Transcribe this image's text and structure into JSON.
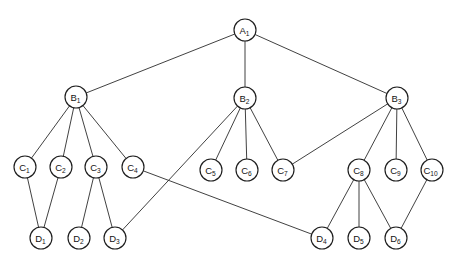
{
  "diagram": {
    "type": "node-link tree diagram",
    "node_shape": "circle",
    "node_radius": 11,
    "colors": {
      "background": "#ffffff",
      "node_fill": "#ffffff",
      "node_stroke": "#1e1e1e",
      "edge_stroke": "#2b2b2b",
      "label_color": "#131313"
    },
    "levels": [
      "A",
      "B",
      "C",
      "D"
    ],
    "nodes": [
      {
        "id": "A1",
        "base": "A",
        "sub": "1",
        "x": 245,
        "y": 30,
        "level": 0
      },
      {
        "id": "B1",
        "base": "B",
        "sub": "1",
        "x": 76,
        "y": 97,
        "level": 1
      },
      {
        "id": "B2",
        "base": "B",
        "sub": "2",
        "x": 245,
        "y": 98,
        "level": 1
      },
      {
        "id": "B3",
        "base": "B",
        "sub": "3",
        "x": 397,
        "y": 98,
        "level": 1
      },
      {
        "id": "C1",
        "base": "C",
        "sub": "1",
        "x": 25,
        "y": 167,
        "level": 2
      },
      {
        "id": "C2",
        "base": "C",
        "sub": "2",
        "x": 61,
        "y": 167,
        "level": 2
      },
      {
        "id": "C3",
        "base": "C",
        "sub": "3",
        "x": 96,
        "y": 167,
        "level": 2
      },
      {
        "id": "C4",
        "base": "C",
        "sub": "4",
        "x": 133,
        "y": 167,
        "level": 2
      },
      {
        "id": "C5",
        "base": "C",
        "sub": "5",
        "x": 211,
        "y": 170,
        "level": 2
      },
      {
        "id": "C6",
        "base": "C",
        "sub": "6",
        "x": 247,
        "y": 170,
        "level": 2
      },
      {
        "id": "C7",
        "base": "C",
        "sub": "7",
        "x": 283,
        "y": 170,
        "level": 2
      },
      {
        "id": "C8",
        "base": "C",
        "sub": "8",
        "x": 359,
        "y": 170,
        "level": 2
      },
      {
        "id": "C9",
        "base": "C",
        "sub": "9",
        "x": 396,
        "y": 170,
        "level": 2
      },
      {
        "id": "C10",
        "base": "C",
        "sub": "10",
        "x": 432,
        "y": 170,
        "level": 2
      },
      {
        "id": "D1",
        "base": "D",
        "sub": "1",
        "x": 41,
        "y": 238,
        "level": 3
      },
      {
        "id": "D2",
        "base": "D",
        "sub": "2",
        "x": 79,
        "y": 238,
        "level": 3
      },
      {
        "id": "D3",
        "base": "D",
        "sub": "3",
        "x": 115,
        "y": 238,
        "level": 3
      },
      {
        "id": "D4",
        "base": "D",
        "sub": "4",
        "x": 322,
        "y": 238,
        "level": 3
      },
      {
        "id": "D5",
        "base": "D",
        "sub": "5",
        "x": 359,
        "y": 238,
        "level": 3
      },
      {
        "id": "D6",
        "base": "D",
        "sub": "6",
        "x": 396,
        "y": 238,
        "level": 3
      }
    ],
    "edges": [
      {
        "from": "A1",
        "to": "B1"
      },
      {
        "from": "A1",
        "to": "B2"
      },
      {
        "from": "A1",
        "to": "B3"
      },
      {
        "from": "B1",
        "to": "C1"
      },
      {
        "from": "B1",
        "to": "C2"
      },
      {
        "from": "B1",
        "to": "C3"
      },
      {
        "from": "B1",
        "to": "C4"
      },
      {
        "from": "B2",
        "to": "C5"
      },
      {
        "from": "B2",
        "to": "C6"
      },
      {
        "from": "B2",
        "to": "C7"
      },
      {
        "from": "B2",
        "to": "D3"
      },
      {
        "from": "B3",
        "to": "C7"
      },
      {
        "from": "B3",
        "to": "C8"
      },
      {
        "from": "B3",
        "to": "C9"
      },
      {
        "from": "B3",
        "to": "C10"
      },
      {
        "from": "C1",
        "to": "D1"
      },
      {
        "from": "C2",
        "to": "D1"
      },
      {
        "from": "C3",
        "to": "D2"
      },
      {
        "from": "C3",
        "to": "D3"
      },
      {
        "from": "C4",
        "to": "D4"
      },
      {
        "from": "C8",
        "to": "D4"
      },
      {
        "from": "C8",
        "to": "D5"
      },
      {
        "from": "C8",
        "to": "D6"
      },
      {
        "from": "C10",
        "to": "D6"
      }
    ]
  }
}
